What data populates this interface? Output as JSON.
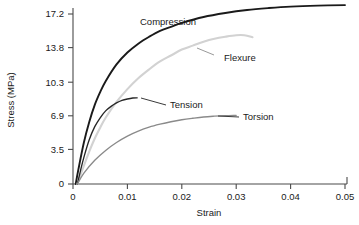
{
  "chart_data": {
    "type": "line",
    "title": "",
    "xlabel": "Strain",
    "ylabel": "Stress (MPa)",
    "xlim": [
      0,
      0.05
    ],
    "ylim": [
      0,
      18.5
    ],
    "grid": false,
    "legend_position": "inline-annotations",
    "x_ticks": [
      "0",
      "0.01",
      "0.02",
      "0.03",
      "0.04",
      "0.05"
    ],
    "x_tick_values": [
      0,
      0.01,
      0.02,
      0.03,
      0.04,
      0.05
    ],
    "y_ticks": [
      "0",
      "3.5",
      "6.9",
      "10.3",
      "13.8",
      "17.2"
    ],
    "y_tick_values": [
      0,
      3.5,
      6.9,
      10.3,
      13.8,
      17.2
    ],
    "series": [
      {
        "name": "Compression",
        "color": "#1a1a1a",
        "width": 1.9,
        "x": [
          0.0005,
          0.001,
          0.002,
          0.003,
          0.004,
          0.005,
          0.006,
          0.008,
          0.01,
          0.012,
          0.014,
          0.016,
          0.018,
          0.02,
          0.024,
          0.028,
          0.032,
          0.036,
          0.04,
          0.045,
          0.05
        ],
        "y": [
          0.0,
          1.5,
          4.2,
          6.3,
          8.0,
          9.3,
          10.4,
          12.1,
          13.3,
          14.2,
          14.9,
          15.5,
          15.9,
          16.3,
          16.9,
          17.3,
          17.6,
          17.8,
          17.95,
          18.05,
          18.1
        ]
      },
      {
        "name": "Flexure",
        "color": "#d2d2d2",
        "width": 2.1,
        "x": [
          0.0008,
          0.0015,
          0.003,
          0.004,
          0.005,
          0.006,
          0.008,
          0.01,
          0.012,
          0.014,
          0.016,
          0.018,
          0.02,
          0.022,
          0.024,
          0.026,
          0.028,
          0.03,
          0.0315,
          0.033
        ],
        "y": [
          0.0,
          1.1,
          3.3,
          4.6,
          5.7,
          6.7,
          8.3,
          9.6,
          10.7,
          11.6,
          12.4,
          13.0,
          13.6,
          14.0,
          14.4,
          14.7,
          14.9,
          15.05,
          15.05,
          14.85
        ]
      },
      {
        "name": "Tension",
        "color": "#262626",
        "width": 1.35,
        "x": [
          0.0008,
          0.0014,
          0.002,
          0.003,
          0.004,
          0.005,
          0.006,
          0.007,
          0.008,
          0.009,
          0.01,
          0.011,
          0.0118
        ],
        "y": [
          0.0,
          1.4,
          2.7,
          4.5,
          5.8,
          6.7,
          7.4,
          7.85,
          8.2,
          8.45,
          8.6,
          8.7,
          8.72
        ]
      },
      {
        "name": "Torsion",
        "color": "#8a8a8a",
        "width": 1.35,
        "x": [
          0.0008,
          0.002,
          0.004,
          0.006,
          0.008,
          0.01,
          0.012,
          0.014,
          0.016,
          0.018,
          0.02,
          0.022,
          0.024,
          0.026,
          0.028,
          0.03
        ],
        "y": [
          0.0,
          1.1,
          2.4,
          3.4,
          4.2,
          4.85,
          5.35,
          5.75,
          6.05,
          6.3,
          6.5,
          6.65,
          6.78,
          6.86,
          6.92,
          6.95
        ]
      }
    ],
    "annotations": [
      {
        "text": "Compression",
        "series": "Compression"
      },
      {
        "text": "Flexure",
        "series": "Flexure"
      },
      {
        "text": "Tension",
        "series": "Tension"
      },
      {
        "text": "Torsion",
        "series": "Torsion"
      }
    ]
  }
}
